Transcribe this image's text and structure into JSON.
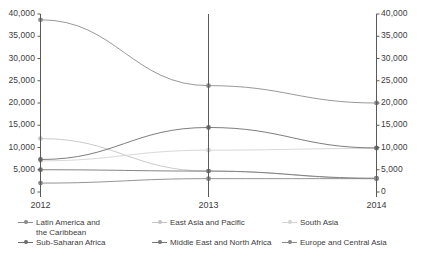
{
  "chart_data": {
    "type": "line",
    "title": "",
    "subtitle": "",
    "xlabel": "",
    "ylabel": "",
    "x": [
      "2012",
      "2013",
      "2014"
    ],
    "categories": [
      "2012",
      "2013",
      "2014"
    ],
    "ylim": [
      0,
      40000
    ],
    "y_right_lim": [
      0,
      40000
    ],
    "yticks": [
      0,
      5000,
      10000,
      15000,
      20000,
      25000,
      30000,
      35000,
      40000
    ],
    "ytick_labels": [
      "0",
      "5,000",
      "10,000",
      "15,000",
      "20,000",
      "25,000",
      "30,000",
      "35,000",
      "40,000"
    ],
    "y_right_tick_labels": [
      "0",
      "5,000",
      "10,000",
      "15,000",
      "20,000",
      "25,000",
      "30,000",
      "35,000",
      "40,000"
    ],
    "grid": false,
    "dual_axis": true,
    "legend_position": "bottom",
    "markers": "circle",
    "series": [
      {
        "name": "Latin America and\nthe Caribbean",
        "legend_label": "Latin America and the Caribbean",
        "color": "#8c8c8c",
        "values": [
          38700,
          23900,
          20000
        ]
      },
      {
        "name": "East Asia and Pacific",
        "legend_label": "East Asia and Pacific",
        "color": "#c4c4c4",
        "values": [
          12000,
          4700,
          3000
        ]
      },
      {
        "name": "South Asia",
        "legend_label": "South Asia",
        "color": "#d4d4d4",
        "values": [
          7000,
          9400,
          9800
        ]
      },
      {
        "name": "Sub-Saharan Africa",
        "legend_label": "Sub-Saharan Africa",
        "color": "#6e6e6e",
        "values": [
          7300,
          14500,
          9900
        ]
      },
      {
        "name": "Middle East and North Africa",
        "legend_label": "Middle East and North Africa",
        "color": "#777777",
        "values": [
          5000,
          4700,
          3100
        ]
      },
      {
        "name": "Europe and Central Asia",
        "legend_label": "Europe and Central Asia",
        "color": "#888888",
        "values": [
          2000,
          3000,
          3000
        ]
      }
    ]
  },
  "axes": {
    "left_ticks": [
      "40,000",
      "35,000",
      "30,000",
      "25,000",
      "20,000",
      "15,000",
      "10,000",
      "5,000",
      "0"
    ],
    "right_ticks": [
      "40,000",
      "35,000",
      "30,000",
      "25,000",
      "20,000",
      "15,000",
      "10,000",
      "5,000",
      "0"
    ],
    "x_ticks": [
      "2012",
      "2013",
      "2014"
    ]
  },
  "legend": {
    "items": [
      {
        "label": "Latin America and\nthe Caribbean",
        "color": "#8c8c8c"
      },
      {
        "label": "East Asia and Pacific",
        "color": "#c4c4c4"
      },
      {
        "label": "South Asia",
        "color": "#d4d4d4"
      },
      {
        "label": "Sub-Saharan Africa",
        "color": "#6e6e6e"
      },
      {
        "label": "Middle East and North Africa",
        "color": "#777777"
      },
      {
        "label": "Europe and Central Asia",
        "color": "#888888"
      }
    ]
  }
}
